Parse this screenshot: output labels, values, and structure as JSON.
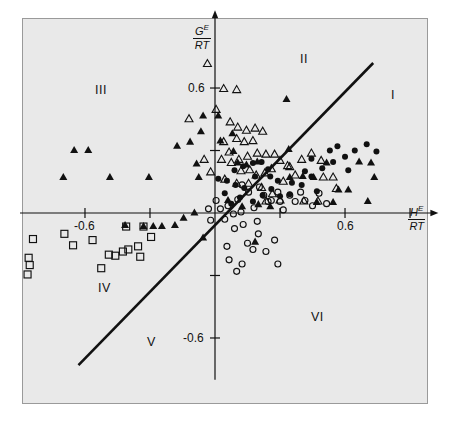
{
  "figure": {
    "background": "#e9e9e9",
    "frame_color": "#9a9a9a",
    "ink": "#111111"
  },
  "axes": {
    "x_title_num": "H",
    "x_title_num_sup": "E",
    "x_title_den": "RT",
    "y_title_num": "G",
    "y_title_num_sup": "E",
    "y_title_den": "RT",
    "x_tick_labels": [
      "-0.6",
      "0.6"
    ],
    "y_tick_labels": [
      "0.6",
      "-0.6"
    ]
  },
  "regions": [
    {
      "id": "I",
      "label": "I",
      "x": 0.74,
      "y": 0.52
    },
    {
      "id": "II",
      "label": "II",
      "x": 0.18,
      "y": 0.8
    },
    {
      "id": "III",
      "label": "III",
      "x": -0.62,
      "y": 0.6
    },
    {
      "id": "IV",
      "label": "IV",
      "x": -0.58,
      "y": -0.33
    },
    {
      "id": "V",
      "label": "V",
      "x": -0.16,
      "y": -0.6
    },
    {
      "id": "VI",
      "label": "VI",
      "x": 0.46,
      "y": -0.46
    }
  ],
  "chart_data": {
    "type": "scatter",
    "title": "",
    "xlabel": "H^E/RT",
    "ylabel": "G^E/RT",
    "xlim": [
      -0.9,
      0.98
    ],
    "ylim": [
      -0.8,
      0.92
    ],
    "grid": false,
    "legend": "none",
    "xticks": [
      -0.6,
      -0.3,
      0.0,
      0.3,
      0.6,
      0.9
    ],
    "yticks": [
      -0.6,
      -0.3,
      0.0,
      0.3,
      0.6
    ],
    "labeled_xticks": [
      -0.6,
      0.6
    ],
    "labeled_yticks": [
      0.6,
      -0.6
    ],
    "reference_line": {
      "name": "diagonal y = x",
      "x_start": -0.63,
      "y_start": -0.73,
      "x_end": 0.73,
      "y_end": 0.72,
      "width_px": 2.6,
      "color": "#111111"
    },
    "series": [
      {
        "name": "filled-circle",
        "marker": "filled-circle",
        "color": "#111111",
        "size_px": 6,
        "points": [
          [
            0.015,
            0.165
          ],
          [
            0.055,
            0.155
          ],
          [
            0.095,
            0.135
          ],
          [
            0.135,
            0.12
          ],
          [
            0.09,
            0.205
          ],
          [
            0.13,
            0.225
          ],
          [
            0.175,
            0.24
          ],
          [
            0.215,
            0.245
          ],
          [
            0.185,
            0.175
          ],
          [
            0.255,
            0.175
          ],
          [
            0.26,
            0.115
          ],
          [
            0.3,
            0.08
          ],
          [
            0.345,
            0.09
          ],
          [
            0.355,
            0.145
          ],
          [
            0.4,
            0.135
          ],
          [
            0.415,
            0.2
          ],
          [
            0.445,
            0.26
          ],
          [
            0.445,
            0.175
          ],
          [
            0.47,
            0.105
          ],
          [
            0.495,
            0.215
          ],
          [
            0.53,
            0.3
          ],
          [
            0.545,
            0.245
          ],
          [
            0.565,
            0.32
          ],
          [
            0.6,
            0.27
          ],
          [
            0.615,
            0.205
          ],
          [
            0.645,
            0.3
          ],
          [
            0.7,
            0.33
          ],
          [
            0.745,
            0.295
          ],
          [
            0.29,
            0.155
          ],
          [
            0.22,
            0.085
          ],
          [
            0.175,
            0.055
          ],
          [
            0.115,
            0.075
          ],
          [
            0.075,
            0.045
          ],
          [
            0.045,
            0.095
          ],
          [
            0.245,
            0.21
          ]
        ]
      },
      {
        "name": "open-circle",
        "marker": "open-circle",
        "color": "#111111",
        "size_px": 6,
        "points": [
          [
            -0.03,
            0.02
          ],
          [
            -0.02,
            -0.035
          ],
          [
            0.005,
            0.06
          ],
          [
            0.025,
            0.02
          ],
          [
            0.045,
            -0.03
          ],
          [
            0.06,
            0.035
          ],
          [
            0.085,
            -0.005
          ],
          [
            0.09,
            -0.075
          ],
          [
            0.105,
            0.065
          ],
          [
            0.12,
            0.005
          ],
          [
            0.13,
            -0.055
          ],
          [
            0.155,
            0.1
          ],
          [
            0.18,
            0.025
          ],
          [
            0.195,
            -0.04
          ],
          [
            0.2,
            -0.1
          ],
          [
            0.225,
            0.085
          ],
          [
            0.245,
            0.055
          ],
          [
            0.26,
            0.06
          ],
          [
            0.29,
            0.1
          ],
          [
            0.3,
            0.055
          ],
          [
            0.315,
            0.015
          ],
          [
            0.345,
            0.085
          ],
          [
            0.37,
            0.055
          ],
          [
            0.395,
            0.1
          ],
          [
            0.415,
            0.06
          ],
          [
            0.45,
            0.035
          ],
          [
            0.48,
            0.095
          ],
          [
            0.515,
            0.045
          ],
          [
            0.15,
            -0.145
          ],
          [
            0.175,
            -0.175
          ],
          [
            0.235,
            -0.185
          ],
          [
            0.275,
            -0.13
          ],
          [
            0.055,
            -0.16
          ],
          [
            0.065,
            -0.225
          ],
          [
            0.125,
            -0.245
          ],
          [
            0.1,
            -0.28
          ],
          [
            0.29,
            -0.245
          ],
          [
            0.125,
            0.135
          ],
          [
            0.205,
            0.125
          ]
        ]
      },
      {
        "name": "filled-triangle",
        "marker": "filled-triangle",
        "color": "#111111",
        "size_px": 8,
        "points": [
          [
            -0.65,
            0.305
          ],
          [
            -0.585,
            0.305
          ],
          [
            -0.7,
            0.175
          ],
          [
            -0.485,
            0.175
          ],
          [
            -0.305,
            0.175
          ],
          [
            -0.175,
            0.325
          ],
          [
            -0.115,
            0.345
          ],
          [
            -0.085,
            0.24
          ],
          [
            -0.075,
            0.175
          ],
          [
            -0.055,
            0.47
          ],
          [
            -0.065,
            0.395
          ],
          [
            0.015,
            0.47
          ],
          [
            0.085,
            0.3
          ],
          [
            0.105,
            0.245
          ],
          [
            0.145,
            0.235
          ],
          [
            0.025,
            0.35
          ],
          [
            0.195,
            0.25
          ],
          [
            0.08,
            0.385
          ],
          [
            0.06,
            0.065
          ],
          [
            0.125,
            0.035
          ],
          [
            0.2,
            0.045
          ],
          [
            0.255,
            0.035
          ],
          [
            0.33,
            0.55
          ],
          [
            0.34,
            0.31
          ],
          [
            0.345,
            0.175
          ],
          [
            0.405,
            0.18
          ],
          [
            0.455,
            0.175
          ],
          [
            0.515,
            0.245
          ],
          [
            0.57,
            0.115
          ],
          [
            0.615,
            0.115
          ],
          [
            0.665,
            0.25
          ],
          [
            0.72,
            0.245
          ],
          [
            0.735,
            0.175
          ],
          [
            0.705,
            0.06
          ],
          [
            0.47,
            0.055
          ],
          [
            0.545,
            0.055
          ],
          [
            -0.33,
            -0.06
          ],
          [
            -0.285,
            -0.06
          ],
          [
            -0.245,
            -0.06
          ],
          [
            -0.145,
            -0.02
          ],
          [
            -0.095,
            0.005
          ],
          [
            -0.055,
            -0.115
          ],
          [
            -0.185,
            -0.055
          ],
          [
            -0.415,
            -0.055
          ],
          [
            0.185,
            -0.135
          ]
        ]
      },
      {
        "name": "open-triangle",
        "marker": "open-triangle",
        "color": "#111111",
        "size_px": 8,
        "points": [
          [
            -0.035,
            0.72
          ],
          [
            0.04,
            0.6
          ],
          [
            0.1,
            0.595
          ],
          [
            -0.12,
            0.455
          ],
          [
            0.005,
            0.5
          ],
          [
            0.07,
            0.44
          ],
          [
            0.105,
            0.415
          ],
          [
            0.145,
            0.4
          ],
          [
            0.185,
            0.41
          ],
          [
            0.22,
            0.395
          ],
          [
            0.04,
            0.345
          ],
          [
            0.1,
            0.36
          ],
          [
            0.135,
            0.345
          ],
          [
            0.175,
            0.35
          ],
          [
            0.065,
            0.295
          ],
          [
            0.03,
            0.26
          ],
          [
            0.075,
            0.245
          ],
          [
            0.11,
            0.26
          ],
          [
            0.15,
            0.275
          ],
          [
            0.195,
            0.29
          ],
          [
            0.235,
            0.285
          ],
          [
            0.275,
            0.285
          ],
          [
            0.12,
            0.205
          ],
          [
            0.16,
            0.21
          ],
          [
            0.19,
            0.185
          ],
          [
            0.23,
            0.195
          ],
          [
            0.26,
            0.215
          ],
          [
            0.3,
            0.255
          ],
          [
            -0.02,
            0.2
          ],
          [
            -0.05,
            0.26
          ],
          [
            0.045,
            0.165
          ],
          [
            0.1,
            0.145
          ],
          [
            0.155,
            0.145
          ],
          [
            0.215,
            0.125
          ],
          [
            0.335,
            0.23
          ],
          [
            0.37,
            0.185
          ],
          [
            0.315,
            0.155
          ],
          [
            0.4,
            0.26
          ],
          [
            0.445,
            0.29
          ],
          [
            0.49,
            0.255
          ],
          [
            0.5,
            0.175
          ],
          [
            0.545,
            0.175
          ],
          [
            0.56,
            0.12
          ],
          [
            0.3,
            0.065
          ],
          [
            0.235,
            0.06
          ],
          [
            0.265,
            0.095
          ],
          [
            0.41,
            0.06
          ],
          [
            0.475,
            0.06
          ],
          [
            0.345,
            0.225
          ]
        ]
      },
      {
        "name": "open-square",
        "marker": "open-square",
        "color": "#111111",
        "size_px": 7,
        "points": [
          [
            -0.84,
            -0.125
          ],
          [
            -0.86,
            -0.215
          ],
          [
            -0.855,
            -0.25
          ],
          [
            -0.865,
            -0.295
          ],
          [
            -0.695,
            -0.1
          ],
          [
            -0.655,
            -0.155
          ],
          [
            -0.565,
            -0.13
          ],
          [
            -0.49,
            -0.2
          ],
          [
            -0.46,
            -0.205
          ],
          [
            -0.425,
            -0.185
          ],
          [
            -0.4,
            -0.175
          ],
          [
            -0.355,
            -0.16
          ],
          [
            -0.345,
            -0.21
          ],
          [
            -0.33,
            -0.065
          ],
          [
            -0.295,
            -0.115
          ],
          [
            -0.525,
            -0.265
          ],
          [
            -0.41,
            -0.065
          ]
        ]
      }
    ]
  }
}
